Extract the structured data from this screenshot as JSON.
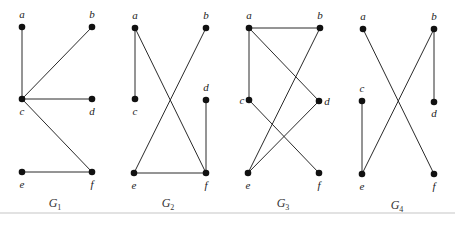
{
  "figure": {
    "graphs": [
      {
        "name": "G1",
        "label": "G",
        "subscript": "1",
        "label_pos": [
          55,
          207
        ],
        "nodes": {
          "a": {
            "x": 22,
            "y": 27,
            "lx": 22,
            "ly": 18,
            "anchor": "middle"
          },
          "b": {
            "x": 92,
            "y": 27,
            "lx": 92,
            "ly": 18,
            "anchor": "middle"
          },
          "c": {
            "x": 22,
            "y": 99,
            "lx": 22,
            "ly": 115,
            "anchor": "middle"
          },
          "d": {
            "x": 92,
            "y": 99,
            "lx": 92,
            "ly": 115,
            "anchor": "middle"
          },
          "e": {
            "x": 22,
            "y": 172,
            "lx": 22,
            "ly": 188,
            "anchor": "middle"
          },
          "f": {
            "x": 92,
            "y": 172,
            "lx": 92,
            "ly": 188,
            "anchor": "middle"
          }
        },
        "edges": [
          [
            "a",
            "c"
          ],
          [
            "b",
            "c"
          ],
          [
            "c",
            "d"
          ],
          [
            "c",
            "f"
          ],
          [
            "e",
            "f"
          ]
        ]
      },
      {
        "name": "G2",
        "label": "G",
        "subscript": "2",
        "label_pos": [
          168,
          207
        ],
        "nodes": {
          "a": {
            "x": 135,
            "y": 28,
            "lx": 135,
            "ly": 19,
            "anchor": "middle"
          },
          "b": {
            "x": 206,
            "y": 28,
            "lx": 206,
            "ly": 19,
            "anchor": "middle"
          },
          "c": {
            "x": 135,
            "y": 99,
            "lx": 135,
            "ly": 115,
            "anchor": "middle"
          },
          "d": {
            "x": 206,
            "y": 100,
            "lx": 206,
            "ly": 91,
            "anchor": "middle"
          },
          "e": {
            "x": 134,
            "y": 173,
            "lx": 134,
            "ly": 189,
            "anchor": "middle"
          },
          "f": {
            "x": 206,
            "y": 173,
            "lx": 206,
            "ly": 189,
            "anchor": "middle"
          }
        },
        "edges": [
          [
            "a",
            "c"
          ],
          [
            "a",
            "f"
          ],
          [
            "b",
            "e"
          ],
          [
            "d",
            "f"
          ],
          [
            "e",
            "f"
          ]
        ]
      },
      {
        "name": "G3",
        "label": "G",
        "subscript": "3",
        "label_pos": [
          283,
          207
        ],
        "nodes": {
          "a": {
            "x": 249,
            "y": 28,
            "lx": 249,
            "ly": 19,
            "anchor": "middle"
          },
          "b": {
            "x": 320,
            "y": 28,
            "lx": 320,
            "ly": 19,
            "anchor": "middle"
          },
          "c": {
            "x": 249,
            "y": 100,
            "lx": 242,
            "ly": 104,
            "anchor": "middle"
          },
          "d": {
            "x": 319,
            "y": 101,
            "lx": 327,
            "ly": 105,
            "anchor": "middle"
          },
          "e": {
            "x": 248,
            "y": 173,
            "lx": 248,
            "ly": 189,
            "anchor": "middle"
          },
          "f": {
            "x": 319,
            "y": 173,
            "lx": 319,
            "ly": 189,
            "anchor": "middle"
          }
        },
        "edges": [
          [
            "a",
            "b"
          ],
          [
            "a",
            "c"
          ],
          [
            "a",
            "d"
          ],
          [
            "b",
            "e"
          ],
          [
            "c",
            "f"
          ],
          [
            "d",
            "e"
          ]
        ]
      },
      {
        "name": "G4",
        "label": "G",
        "subscript": "4",
        "label_pos": [
          397,
          209
        ],
        "nodes": {
          "a": {
            "x": 363,
            "y": 29,
            "lx": 363,
            "ly": 20,
            "anchor": "middle"
          },
          "b": {
            "x": 434,
            "y": 29,
            "lx": 434,
            "ly": 20,
            "anchor": "middle"
          },
          "c": {
            "x": 362,
            "y": 101,
            "lx": 362,
            "ly": 92,
            "anchor": "middle"
          },
          "d": {
            "x": 434,
            "y": 102,
            "lx": 434,
            "ly": 117,
            "anchor": "middle"
          },
          "e": {
            "x": 362,
            "y": 174,
            "lx": 362,
            "ly": 190,
            "anchor": "middle"
          },
          "f": {
            "x": 434,
            "y": 174,
            "lx": 434,
            "ly": 190,
            "anchor": "middle"
          }
        },
        "edges": [
          [
            "a",
            "f"
          ],
          [
            "b",
            "e"
          ],
          [
            "b",
            "d"
          ],
          [
            "c",
            "e"
          ]
        ]
      }
    ],
    "rule": {
      "y": 213,
      "x1": 0,
      "x2": 455
    }
  }
}
